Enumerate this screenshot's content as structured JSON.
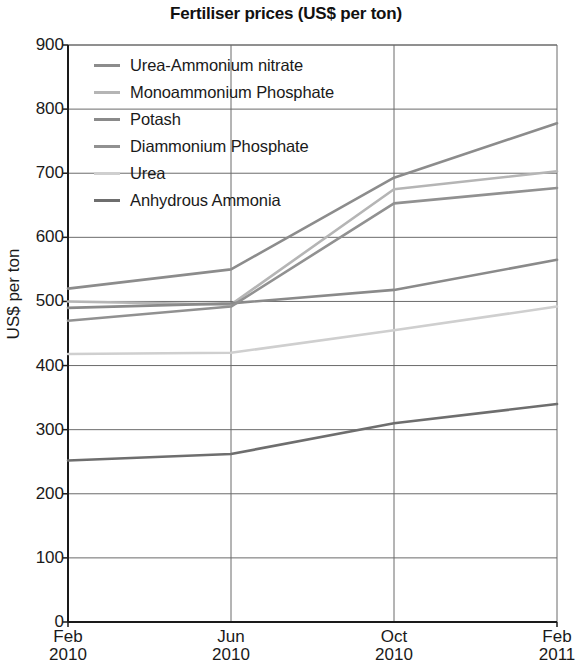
{
  "chart_data": {
    "type": "line",
    "title": "Fertiliser prices (US$ per ton)",
    "xlabel": "",
    "ylabel": "US$ per ton",
    "ylim": [
      0,
      900
    ],
    "ytick_step": 100,
    "yticks": [
      900,
      800,
      700,
      600,
      500,
      400,
      300,
      200,
      100,
      0
    ],
    "grid": true,
    "legend_position": "top-left inside plot",
    "categories": [
      "Feb 2010",
      "Jun 2010",
      "Oct 2010",
      "Feb 2011"
    ],
    "xtick_labels": [
      {
        "month": "Feb",
        "year": "2010"
      },
      {
        "month": "Jun",
        "year": "2010"
      },
      {
        "month": "Oct",
        "year": "2010"
      },
      {
        "month": "Feb",
        "year": "2011"
      }
    ],
    "series": [
      {
        "name": "Urea-Ammonium nitrate",
        "color": "#8c8c8c",
        "values": [
          520,
          550,
          693,
          778
        ]
      },
      {
        "name": "Monoammonium Phosphate",
        "color": "#b5b5b5",
        "values": [
          500,
          495,
          675,
          703
        ]
      },
      {
        "name": "Potash",
        "color": "#8a8a8a",
        "values": [
          490,
          497,
          518,
          565
        ]
      },
      {
        "name": "Diammonium Phosphate",
        "color": "#919191",
        "values": [
          470,
          492,
          653,
          677
        ]
      },
      {
        "name": "Urea",
        "color": "#cfcfcf",
        "values": [
          418,
          420,
          455,
          492
        ]
      },
      {
        "name": "Anhydrous Ammonia",
        "color": "#6e6e6e",
        "values": [
          252,
          262,
          310,
          340
        ]
      }
    ]
  },
  "legend": {
    "items": [
      "Urea-Ammonium nitrate",
      "Monoammonium Phosphate",
      "Potash",
      "Diammonium Phosphate",
      "Urea",
      "Anhydrous Ammonia"
    ]
  },
  "colors": {
    "axis": "#1a1a1a",
    "gridline": "#6b6b6b",
    "background": "#ffffff",
    "text": "#1a1a1a"
  }
}
